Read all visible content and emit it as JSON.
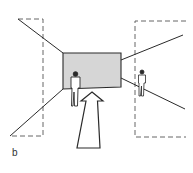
{
  "figure": {
    "label": "b",
    "colors": {
      "stroke": "#2a2a2a",
      "dashed": "#555555",
      "wall_fill": "#d6d6d6",
      "background": "#ffffff"
    },
    "elements": {
      "end_wall": "shaded rectangular end wall",
      "left_frame": "dashed left viewing frame",
      "right_frame": "dashed right viewing frame",
      "arrow": "direction of movement arrow",
      "person_left": "standing person near end wall",
      "person_right": "standing person in right frame"
    }
  }
}
